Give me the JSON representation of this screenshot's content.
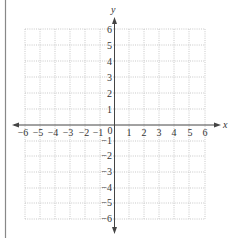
{
  "figure": {
    "type": "coordinate-plane",
    "x_axis_label": "x",
    "y_axis_label": "y",
    "origin_label": "0",
    "x_ticks": [
      "-6",
      "-5",
      "-4",
      "-3",
      "-2",
      "-1",
      "1",
      "2",
      "3",
      "4",
      "5",
      "6"
    ],
    "y_ticks": [
      "6",
      "5",
      "4",
      "3",
      "2",
      "1",
      "-1",
      "-2",
      "-3",
      "-4",
      "-5",
      "-6"
    ],
    "x_range": [
      -6,
      6
    ],
    "y_range": [
      -6,
      6
    ],
    "grid": "dotted",
    "colors": {
      "axis": "#444444",
      "grid": "#b8b8b8",
      "text": "#333333",
      "border": "#888888"
    }
  },
  "labels": {
    "x_neg6": "−6",
    "x_neg5": "−5",
    "x_neg4": "−4",
    "x_neg3": "−3",
    "x_neg2": "−2",
    "x_neg1": "−1",
    "x_1": "1",
    "x_2": "2",
    "x_3": "3",
    "x_4": "4",
    "x_5": "5",
    "x_6": "6",
    "y_6": "6",
    "y_5": "5",
    "y_4": "4",
    "y_3": "3",
    "y_2": "2",
    "y_1": "1",
    "y_neg1": "−1",
    "y_neg2": "−2",
    "y_neg3": "−3",
    "y_neg4": "−4",
    "y_neg5": "−5",
    "y_neg6": "−6"
  }
}
